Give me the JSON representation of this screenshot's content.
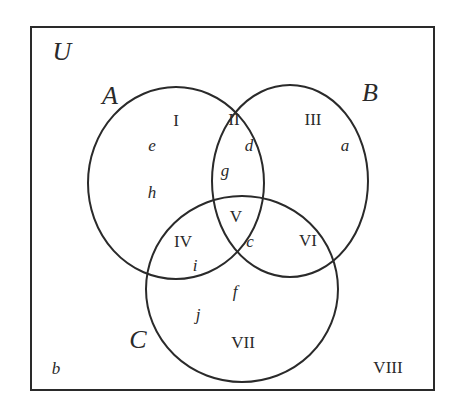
{
  "diagram": {
    "type": "venn",
    "universe": {
      "label": "U",
      "x": 62,
      "y": 52
    },
    "sets": [
      {
        "label": "A",
        "x": 110,
        "y": 96,
        "cx": 176,
        "cy": 183,
        "rx": 88,
        "ry": 96
      },
      {
        "label": "B",
        "x": 370,
        "y": 93,
        "cx": 290,
        "cy": 181,
        "rx": 78,
        "ry": 96
      },
      {
        "label": "C",
        "x": 138,
        "y": 340,
        "cx": 242,
        "cy": 289,
        "rx": 96,
        "ry": 93
      }
    ],
    "regions": [
      {
        "label": "I",
        "x": 176,
        "y": 120
      },
      {
        "label": "II",
        "x": 234,
        "y": 119
      },
      {
        "label": "III",
        "x": 313,
        "y": 119
      },
      {
        "label": "IV",
        "x": 183,
        "y": 241
      },
      {
        "label": "V",
        "x": 236,
        "y": 216
      },
      {
        "label": "VI",
        "x": 308,
        "y": 240
      },
      {
        "label": "VII",
        "x": 243,
        "y": 342
      },
      {
        "label": "VIII",
        "x": 388,
        "y": 367
      }
    ],
    "elements": [
      {
        "label": "e",
        "x": 152,
        "y": 145
      },
      {
        "label": "d",
        "x": 249,
        "y": 145
      },
      {
        "label": "a",
        "x": 345,
        "y": 145
      },
      {
        "label": "g",
        "x": 225,
        "y": 170
      },
      {
        "label": "h",
        "x": 152,
        "y": 192
      },
      {
        "label": "c",
        "x": 250,
        "y": 241
      },
      {
        "label": "i",
        "x": 195,
        "y": 265
      },
      {
        "label": "f",
        "x": 235,
        "y": 291
      },
      {
        "label": "j",
        "x": 198,
        "y": 314
      },
      {
        "label": "b",
        "x": 56,
        "y": 368
      }
    ],
    "colors": {
      "line": "#2a2a2a",
      "background": "#ffffff"
    }
  }
}
